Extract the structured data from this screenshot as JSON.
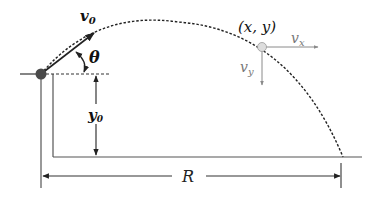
{
  "diagram": {
    "labels": {
      "initial_velocity": "v",
      "initial_velocity_sub": "0",
      "angle": "θ",
      "point": "(x, y)",
      "vx": "v",
      "vx_sub": "x",
      "vy": "v",
      "vy_sub": "y",
      "height": "y",
      "height_sub": "0",
      "range": "R"
    },
    "colors": {
      "line": "#333333",
      "ball": "#4a4a4a",
      "component_arrows": "#8a8a8a",
      "point_fill": "#dddddd"
    }
  }
}
